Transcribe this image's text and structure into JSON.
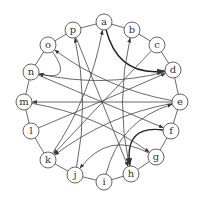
{
  "diagram": {
    "type": "directed-graph",
    "layout": "circular",
    "colors": {
      "node_stroke": "#555555",
      "node_fill": "#ffffff",
      "edge": "#444444",
      "edge_bold": "#222222",
      "label": "#333333"
    },
    "nodes": [
      {
        "id": "a",
        "label": "a",
        "x": 104,
        "y": 22
      },
      {
        "id": "b",
        "label": "b",
        "x": 132,
        "y": 30
      },
      {
        "id": "c",
        "label": "c",
        "x": 157,
        "y": 45
      },
      {
        "id": "d",
        "label": "d",
        "x": 173,
        "y": 70
      },
      {
        "id": "e",
        "label": "e",
        "x": 180,
        "y": 102
      },
      {
        "id": "f",
        "label": "f",
        "x": 171,
        "y": 131
      },
      {
        "id": "g",
        "label": "g",
        "x": 156,
        "y": 157
      },
      {
        "id": "h",
        "label": "h",
        "x": 131,
        "y": 174
      },
      {
        "id": "i",
        "label": "i",
        "x": 104,
        "y": 182
      },
      {
        "id": "j",
        "label": "j",
        "x": 75,
        "y": 175
      },
      {
        "id": "k",
        "label": "k",
        "x": 48,
        "y": 160
      },
      {
        "id": "l",
        "label": "l",
        "x": 31,
        "y": 131
      },
      {
        "id": "m",
        "label": "m",
        "x": 24,
        "y": 102
      },
      {
        "id": "n",
        "label": "n",
        "x": 31,
        "y": 72
      },
      {
        "id": "o",
        "label": "o",
        "x": 48,
        "y": 45
      },
      {
        "id": "p",
        "label": "p",
        "x": 73,
        "y": 30
      }
    ],
    "ring_edges": [
      [
        "a",
        "b"
      ],
      [
        "b",
        "c"
      ],
      [
        "c",
        "d"
      ],
      [
        "d",
        "e"
      ],
      [
        "e",
        "f"
      ],
      [
        "f",
        "g"
      ],
      [
        "g",
        "h"
      ],
      [
        "h",
        "i"
      ],
      [
        "i",
        "j"
      ],
      [
        "j",
        "k"
      ],
      [
        "k",
        "l"
      ],
      [
        "l",
        "m"
      ],
      [
        "m",
        "n"
      ],
      [
        "n",
        "o"
      ],
      [
        "o",
        "p"
      ],
      [
        "p",
        "a"
      ]
    ],
    "directed_edges": [
      {
        "from": "a",
        "to": "d",
        "bold": true
      },
      {
        "from": "o",
        "to": "n"
      },
      {
        "from": "d",
        "to": "n"
      },
      {
        "from": "e",
        "to": "o"
      },
      {
        "from": "j",
        "to": "p"
      },
      {
        "from": "k",
        "to": "a"
      },
      {
        "from": "h",
        "to": "b"
      },
      {
        "from": "c",
        "to": "k"
      },
      {
        "from": "p",
        "to": "h"
      },
      {
        "from": "l",
        "to": "d"
      },
      {
        "from": "e",
        "to": "m"
      },
      {
        "from": "n",
        "to": "f"
      },
      {
        "from": "i",
        "to": "e"
      },
      {
        "from": "f",
        "to": "h",
        "bold": true
      },
      {
        "from": "e",
        "to": "k"
      },
      {
        "from": "g",
        "to": "j"
      },
      {
        "from": "m",
        "to": "g"
      }
    ]
  }
}
